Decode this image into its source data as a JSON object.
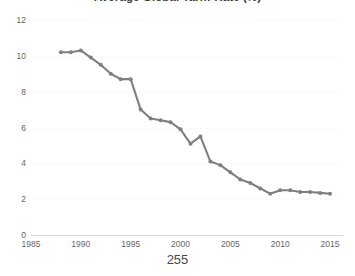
{
  "page": {
    "number": "255"
  },
  "chart_data": {
    "type": "line",
    "title": "Average Global Tariff Rate (%)",
    "xlabel": "",
    "ylabel": "",
    "xlim": [
      1985,
      2016
    ],
    "ylim": [
      0,
      12
    ],
    "grid": true,
    "legend": null,
    "series_color": "#7f7f7f",
    "marker": "circle",
    "x_ticks": [
      "1985",
      "1990",
      "1995",
      "2000",
      "2005",
      "2010",
      "2015"
    ],
    "y_ticks": [
      "0",
      "2",
      "4",
      "6",
      "8",
      "10",
      "12"
    ],
    "x": [
      1988,
      1989,
      1990,
      1991,
      1992,
      1993,
      1994,
      1995,
      1996,
      1997,
      1998,
      1999,
      2000,
      2001,
      2002,
      2003,
      2004,
      2005,
      2006,
      2007,
      2008,
      2009,
      2010,
      2011,
      2012,
      2013,
      2014,
      2015
    ],
    "values": [
      10.2,
      10.2,
      10.3,
      9.9,
      9.5,
      9.0,
      8.7,
      8.7,
      7.0,
      6.5,
      6.4,
      6.3,
      5.9,
      5.1,
      5.5,
      4.1,
      3.9,
      3.5,
      3.1,
      2.9,
      2.6,
      2.3,
      2.5,
      2.5,
      2.4,
      2.4,
      2.35,
      2.3
    ]
  }
}
